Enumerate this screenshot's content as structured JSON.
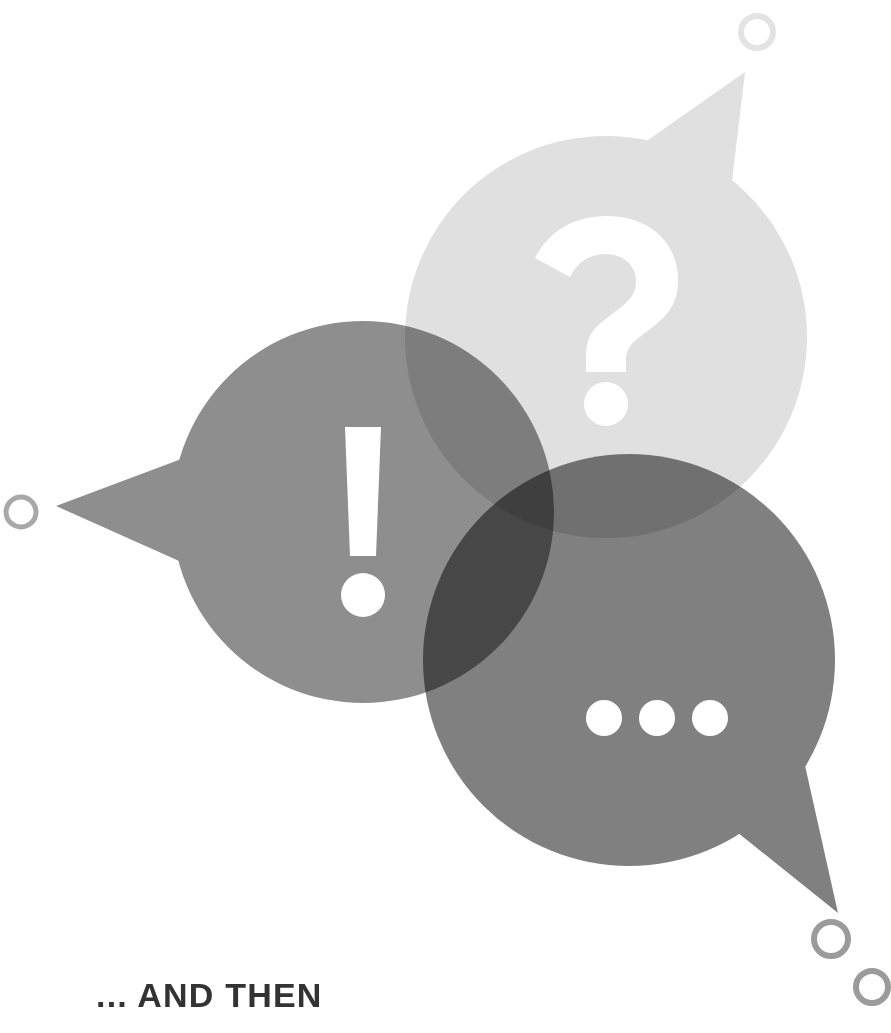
{
  "page": {
    "width": 891,
    "height": 1033,
    "background_color": "#ffffff"
  },
  "caption": {
    "text": "... AND THEN",
    "color": "#333333"
  },
  "artwork": {
    "name": "three-overlapping-speech-bubbles",
    "blend_mode": "multiply",
    "bubbles": [
      {
        "id": "question-bubble",
        "symbol": "?",
        "symbol_name": "question-mark",
        "fill": "#e0e0e0",
        "cx": 606,
        "cy": 337,
        "r": 201,
        "tail": "745,72 648,140 726,232",
        "tail_direction": "up-right"
      },
      {
        "id": "exclamation-bubble",
        "symbol": "!",
        "symbol_name": "exclamation-mark",
        "fill": "#8e8e8e",
        "cx": 363,
        "cy": 512,
        "r": 191,
        "tail": "56,506 200,452 206,573",
        "tail_direction": "left"
      },
      {
        "id": "ellipsis-bubble",
        "symbol": "...",
        "symbol_name": "ellipsis-dots",
        "fill": "#808080",
        "cx": 629,
        "cy": 660,
        "r": 206,
        "tail": "838,913 722,820 802,752",
        "tail_direction": "down-right"
      }
    ],
    "glyph_color": "#ffffff",
    "rings": [
      {
        "id": "ring-top-right",
        "cx": 757,
        "cy": 32,
        "r": 16,
        "stroke": "#e3e3e3",
        "stroke_width": 6
      },
      {
        "id": "ring-left",
        "cx": 21,
        "cy": 512,
        "r": 15,
        "stroke": "#a8a8a8",
        "stroke_width": 5
      },
      {
        "id": "ring-bottom-right-upper",
        "cx": 831,
        "cy": 939,
        "r": 17,
        "stroke": "#9b9b9b",
        "stroke_width": 6
      },
      {
        "id": "ring-bottom-right-lower",
        "cx": 872,
        "cy": 987,
        "r": 16,
        "stroke": "#9b9b9b",
        "stroke_width": 6
      }
    ]
  }
}
